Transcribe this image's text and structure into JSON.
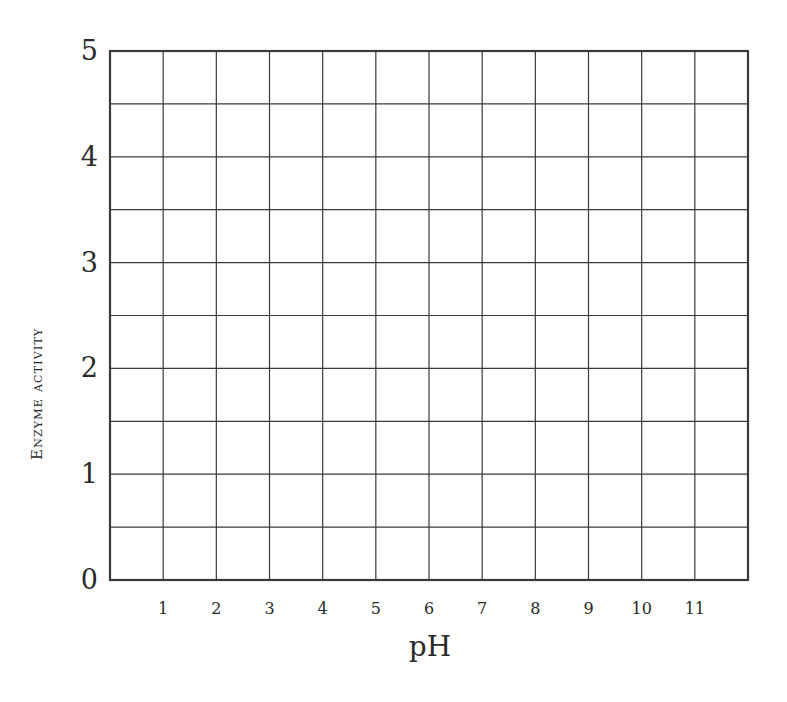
{
  "chart_data": {
    "type": "line",
    "title": "",
    "xlabel": "pH",
    "ylabel": "Enzyme activity",
    "x_ticks": [
      "1",
      "2",
      "3",
      "4",
      "5",
      "6",
      "7",
      "8",
      "9",
      "10",
      "11"
    ],
    "y_ticks": [
      "0",
      "1",
      "2",
      "3",
      "4",
      "5"
    ],
    "xlim": [
      0,
      12
    ],
    "ylim": [
      0,
      5
    ],
    "grid": true,
    "grid_minor_y_step": 0.5,
    "grid_x_step": 1,
    "series": [],
    "note": "Blank graph grid with no plotted data"
  },
  "colors": {
    "grid": "#3a3a3a",
    "text": "#2a2a2a",
    "background": "#ffffff"
  }
}
